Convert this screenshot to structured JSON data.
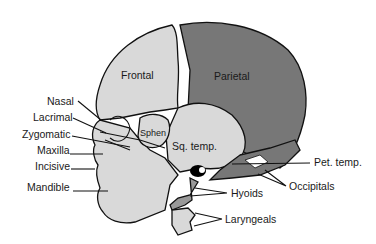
{
  "diagram": {
    "colors": {
      "light_bone": "#d9d9d9",
      "dark_bone": "#777777",
      "outline": "#111111",
      "black": "#000000",
      "background": "#ffffff"
    },
    "inner_labels": {
      "frontal": "Frontal",
      "parietal": "Parietal",
      "sphen": "Sphen",
      "sq_temp": "Sq. temp."
    },
    "callouts": {
      "nasal": "Nasal",
      "lacrimal": "Lacrimal",
      "zygomatic": "Zygomatic",
      "maxilla": "Maxilla",
      "incisive": "Incisive",
      "mandible": "Mandible",
      "pet_temp": "Pet. temp.",
      "occipitals": "Occipitals",
      "hyoids": "Hyoids",
      "laryngeals": "Laryngeals"
    }
  }
}
